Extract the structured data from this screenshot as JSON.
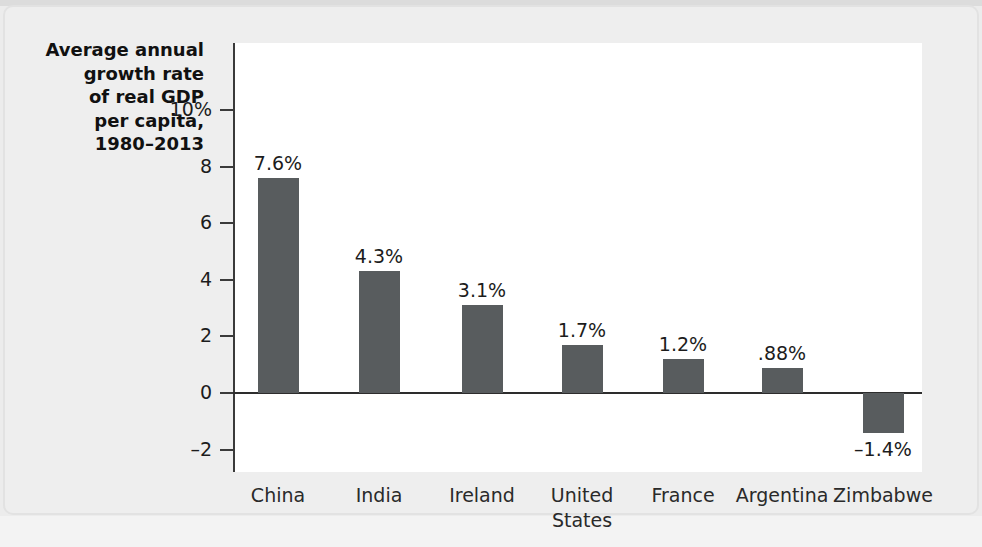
{
  "chart_data": {
    "type": "bar",
    "title": "",
    "ylabel": "Average annual growth rate of real GDP per capita, 1980–2013",
    "ylabel_lines": [
      "Average annual",
      "growth rate",
      "of real GDP",
      "per capita,",
      "1980–2013"
    ],
    "xlabel": "",
    "categories": [
      "China",
      "India",
      "Ireland",
      "United\nStates",
      "France",
      "Argentina",
      "Zimbabwe"
    ],
    "values": [
      7.6,
      4.3,
      3.1,
      1.7,
      1.2,
      0.88,
      -1.4
    ],
    "value_labels": [
      "7.6%",
      "4.3%",
      "3.1%",
      "1.7%",
      "1.2%",
      ".88%",
      "–1.4%"
    ],
    "ylim": [
      -2,
      10
    ],
    "yticks": [
      10,
      8,
      6,
      4,
      2,
      0,
      -2
    ],
    "ytick_labels": [
      "10%",
      "8",
      "6",
      "4",
      "2",
      "0",
      "–2"
    ],
    "grid": false,
    "legend": null,
    "bar_color": "#585c5e",
    "axis_color": "#3a3a3a",
    "plot_background": "#ffffff",
    "figure_background": "#ececec"
  }
}
